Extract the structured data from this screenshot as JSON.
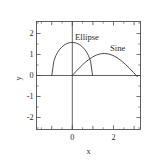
{
  "chart_data": {
    "type": "line",
    "title": "",
    "xlabel": "x",
    "ylabel": "y",
    "xlim": [
      -1.75,
      3.35
    ],
    "ylim": [
      -2.45,
      2.45
    ],
    "grid": false,
    "legend_position": "inline-annotations",
    "xticks": [
      -1,
      0,
      1,
      2,
      3
    ],
    "xticklabels": [
      "",
      "0",
      "",
      "2",
      ""
    ],
    "yticks": [
      -2,
      -1,
      0,
      1,
      2
    ],
    "yticklabels": [
      "-2",
      "-1",
      "0",
      "1",
      "2"
    ],
    "xtick_major_labeled": [
      "0",
      "2"
    ],
    "series": [
      {
        "name": "Ellipse",
        "equation": "y = 1.5*sqrt(1 - x^2)",
        "x_range": [
          -1,
          1
        ],
        "peak": {
          "x": 0,
          "y": 1.5
        },
        "annotation": "Ellipse",
        "annotation_at": {
          "x": 0.18,
          "y": 1.85
        },
        "points": [
          {
            "x": -1.0,
            "y": 0.0
          },
          {
            "x": -0.9,
            "y": 0.654
          },
          {
            "x": -0.8,
            "y": 0.9
          },
          {
            "x": -0.7,
            "y": 1.071
          },
          {
            "x": -0.6,
            "y": 1.2
          },
          {
            "x": -0.5,
            "y": 1.299
          },
          {
            "x": -0.4,
            "y": 1.375
          },
          {
            "x": -0.3,
            "y": 1.431
          },
          {
            "x": -0.2,
            "y": 1.47
          },
          {
            "x": -0.1,
            "y": 1.492
          },
          {
            "x": 0.0,
            "y": 1.5
          },
          {
            "x": 0.1,
            "y": 1.492
          },
          {
            "x": 0.2,
            "y": 1.47
          },
          {
            "x": 0.3,
            "y": 1.431
          },
          {
            "x": 0.4,
            "y": 1.375
          },
          {
            "x": 0.5,
            "y": 1.299
          },
          {
            "x": 0.6,
            "y": 1.2
          },
          {
            "x": 0.7,
            "y": 1.071
          },
          {
            "x": 0.8,
            "y": 0.9
          },
          {
            "x": 0.9,
            "y": 0.654
          },
          {
            "x": 1.0,
            "y": 0.0
          }
        ]
      },
      {
        "name": "Sine",
        "equation": "y = sin(x)",
        "x_range": [
          0,
          3.2
        ],
        "peak": {
          "x": 1.5708,
          "y": 1.0
        },
        "annotation": "Sine",
        "annotation_at": {
          "x": 1.95,
          "y": 1.38
        },
        "points": [
          {
            "x": 0.0,
            "y": 0.0
          },
          {
            "x": 0.2,
            "y": 0.199
          },
          {
            "x": 0.4,
            "y": 0.389
          },
          {
            "x": 0.6,
            "y": 0.565
          },
          {
            "x": 0.8,
            "y": 0.717
          },
          {
            "x": 1.0,
            "y": 0.841
          },
          {
            "x": 1.2,
            "y": 0.932
          },
          {
            "x": 1.4,
            "y": 0.985
          },
          {
            "x": 1.5708,
            "y": 1.0
          },
          {
            "x": 1.8,
            "y": 0.974
          },
          {
            "x": 2.0,
            "y": 0.909
          },
          {
            "x": 2.2,
            "y": 0.808
          },
          {
            "x": 2.4,
            "y": 0.675
          },
          {
            "x": 2.6,
            "y": 0.516
          },
          {
            "x": 2.8,
            "y": 0.335
          },
          {
            "x": 3.0,
            "y": 0.141
          },
          {
            "x": 3.2,
            "y": -0.058
          }
        ]
      }
    ]
  },
  "axes": {
    "x_title": "x",
    "y_title": "y",
    "y_tick_labels": [
      "2",
      "1",
      "0",
      "-1",
      "-2"
    ],
    "x_tick_labels": [
      "0",
      "2"
    ]
  },
  "annotations": {
    "ellipse_label": "Ellipse",
    "sine_label": "Sine"
  },
  "style": {
    "line_color": "#3a3a3a",
    "text_color": "#2b2b2b",
    "background": "#ffffff"
  }
}
